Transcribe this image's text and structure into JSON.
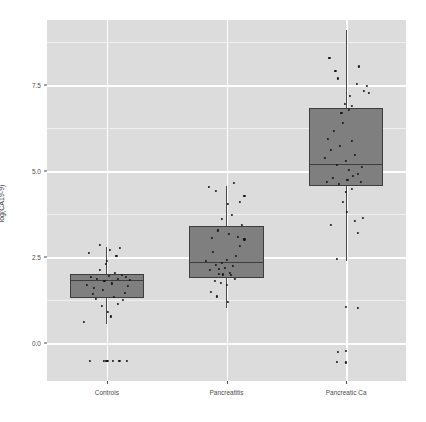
{
  "chart_data": {
    "type": "boxplot",
    "title": "",
    "subtitle": "",
    "xlabel": "",
    "ylabel": "log(CA19-9)",
    "categories": [
      "Controls",
      "Pancreatitis",
      "Pancreatic Ca"
    ],
    "ylim": [
      -1.1,
      9.4
    ],
    "yticks": [
      0.0,
      2.5,
      5.0,
      7.5
    ],
    "ytick_labels": [
      "0.0",
      "2.5",
      "5.0",
      "7.5"
    ],
    "y_minor_ticks": [
      -1.25,
      1.25,
      3.75,
      6.25,
      8.75
    ],
    "grid": "major-and-minor horizontal, major vertical at category centers",
    "legend": "none",
    "theme": "grey background panel, white major gridlines",
    "box_fill": "#7f7f7f",
    "box_outline": "#3d3d3d",
    "point_color": "#141414",
    "panel_background": "#dcdcdc",
    "series": [
      {
        "name": "Controls",
        "box": {
          "q1": 1.3,
          "median": 1.85,
          "q3": 2.02,
          "whisker_low": 0.57,
          "whisker_high": 2.79
        },
        "points": [
          {
            "x": -0.34,
            "y": 1.7
          },
          {
            "x": -0.27,
            "y": 1.92
          },
          {
            "x": -0.21,
            "y": 1.62
          },
          {
            "x": -0.16,
            "y": 1.86
          },
          {
            "x": -0.11,
            "y": 2.13
          },
          {
            "x": -0.07,
            "y": 1.55
          },
          {
            "x": -0.04,
            "y": 1.8
          },
          {
            "x": 0.0,
            "y": 2.4
          },
          {
            "x": 0.04,
            "y": 1.95
          },
          {
            "x": 0.09,
            "y": 1.74
          },
          {
            "x": 0.14,
            "y": 2.05
          },
          {
            "x": 0.19,
            "y": 1.88
          },
          {
            "x": 0.25,
            "y": 1.99
          },
          {
            "x": 0.3,
            "y": 1.46
          },
          {
            "x": 0.35,
            "y": 1.66
          },
          {
            "x": -0.3,
            "y": 2.62
          },
          {
            "x": -0.12,
            "y": 2.85
          },
          {
            "x": 0.05,
            "y": 2.71
          },
          {
            "x": 0.16,
            "y": 2.55
          },
          {
            "x": 0.22,
            "y": 2.77
          },
          {
            "x": -0.02,
            "y": 2.31
          },
          {
            "x": 0.32,
            "y": 1.92
          },
          {
            "x": 0.38,
            "y": 1.84
          },
          {
            "x": -0.24,
            "y": 1.43
          },
          {
            "x": -0.18,
            "y": 1.29
          },
          {
            "x": 0.12,
            "y": 1.35
          },
          {
            "x": 0.27,
            "y": 1.26
          },
          {
            "x": -0.08,
            "y": 1.08
          },
          {
            "x": 0.02,
            "y": 0.9
          },
          {
            "x": 0.18,
            "y": 1.15
          },
          {
            "x": -0.38,
            "y": 0.62
          },
          {
            "x": 0.07,
            "y": 0.78
          },
          {
            "x": -0.05,
            "y": -0.52
          },
          {
            "x": -0.02,
            "y": -0.52
          },
          {
            "x": 0.01,
            "y": -0.52
          },
          {
            "x": 0.1,
            "y": -0.52
          },
          {
            "x": 0.21,
            "y": -0.52
          },
          {
            "x": -0.28,
            "y": -0.52
          },
          {
            "x": 0.33,
            "y": -0.52
          }
        ]
      },
      {
        "name": "Pancreatitis",
        "box": {
          "q1": 1.88,
          "median": 2.36,
          "q3": 3.42,
          "whisker_low": 1.02,
          "whisker_high": 4.58
        },
        "points": [
          {
            "x": -0.35,
            "y": 2.4
          },
          {
            "x": -0.28,
            "y": 2.12
          },
          {
            "x": -0.22,
            "y": 2.65
          },
          {
            "x": -0.17,
            "y": 2.28
          },
          {
            "x": -0.12,
            "y": 2.02
          },
          {
            "x": -0.07,
            "y": 2.34
          },
          {
            "x": -0.03,
            "y": 2.2
          },
          {
            "x": 0.01,
            "y": 2.42
          },
          {
            "x": 0.06,
            "y": 2.05
          },
          {
            "x": 0.11,
            "y": 2.26
          },
          {
            "x": 0.16,
            "y": 2.55
          },
          {
            "x": 0.23,
            "y": 2.82
          },
          {
            "x": 0.3,
            "y": 3.02
          },
          {
            "x": -0.24,
            "y": 3.05
          },
          {
            "x": -0.14,
            "y": 3.28
          },
          {
            "x": 0.04,
            "y": 3.18
          },
          {
            "x": 0.19,
            "y": 3.1
          },
          {
            "x": 0.26,
            "y": 3.45
          },
          {
            "x": -0.08,
            "y": 3.62
          },
          {
            "x": 0.09,
            "y": 3.72
          },
          {
            "x": 0.03,
            "y": 4.05
          },
          {
            "x": 0.22,
            "y": 4.12
          },
          {
            "x": 0.3,
            "y": 4.28
          },
          {
            "x": -0.18,
            "y": 4.42
          },
          {
            "x": -0.3,
            "y": 4.55
          },
          {
            "x": 0.12,
            "y": 4.66
          },
          {
            "x": -0.2,
            "y": 1.82
          },
          {
            "x": -0.1,
            "y": 1.76
          },
          {
            "x": 0.0,
            "y": 1.7
          },
          {
            "x": 0.14,
            "y": 1.88
          },
          {
            "x": -0.26,
            "y": 1.48
          },
          {
            "x": -0.16,
            "y": 1.36
          },
          {
            "x": 0.02,
            "y": 1.2
          },
          {
            "x": -0.06,
            "y": 2.0
          },
          {
            "x": 0.07,
            "y": 1.98
          },
          {
            "x": -0.13,
            "y": 2.16
          }
        ]
      },
      {
        "name": "Pancreatic Ca",
        "box": {
          "q1": 4.58,
          "median": 5.22,
          "q3": 6.84,
          "whisker_low": 2.38,
          "whisker_high": 9.12
        },
        "points": [
          {
            "x": -0.36,
            "y": 5.4
          },
          {
            "x": -0.3,
            "y": 5.95
          },
          {
            "x": -0.25,
            "y": 5.62
          },
          {
            "x": -0.2,
            "y": 6.18
          },
          {
            "x": -0.15,
            "y": 5.18
          },
          {
            "x": -0.1,
            "y": 5.75
          },
          {
            "x": -0.05,
            "y": 6.4
          },
          {
            "x": 0.0,
            "y": 5.3
          },
          {
            "x": 0.05,
            "y": 5.05
          },
          {
            "x": 0.1,
            "y": 5.88
          },
          {
            "x": 0.15,
            "y": 5.48
          },
          {
            "x": 0.2,
            "y": 4.92
          },
          {
            "x": 0.26,
            "y": 5.12
          },
          {
            "x": -0.32,
            "y": 4.7
          },
          {
            "x": -0.22,
            "y": 4.82
          },
          {
            "x": -0.12,
            "y": 4.64
          },
          {
            "x": 0.02,
            "y": 4.74
          },
          {
            "x": 0.12,
            "y": 4.86
          },
          {
            "x": 0.24,
            "y": 4.68
          },
          {
            "x": -0.08,
            "y": 6.7
          },
          {
            "x": 0.04,
            "y": 6.78
          },
          {
            "x": 0.09,
            "y": 6.9
          },
          {
            "x": -0.02,
            "y": 6.95
          },
          {
            "x": 0.3,
            "y": 7.35
          },
          {
            "x": 0.18,
            "y": 7.55
          },
          {
            "x": -0.14,
            "y": 7.7
          },
          {
            "x": 0.35,
            "y": 7.48
          },
          {
            "x": 0.06,
            "y": 7.2
          },
          {
            "x": -0.28,
            "y": 8.3
          },
          {
            "x": -0.18,
            "y": 7.92
          },
          {
            "x": 0.22,
            "y": 8.05
          },
          {
            "x": 0.38,
            "y": 7.28
          },
          {
            "x": 0.01,
            "y": 3.82
          },
          {
            "x": 0.14,
            "y": 3.56
          },
          {
            "x": 0.28,
            "y": 3.65
          },
          {
            "x": -0.26,
            "y": 3.45
          },
          {
            "x": 0.2,
            "y": 3.22
          },
          {
            "x": -0.06,
            "y": 4.12
          },
          {
            "x": -0.16,
            "y": 2.46
          },
          {
            "x": 0.0,
            "y": 1.05
          },
          {
            "x": 0.19,
            "y": 1.02
          },
          {
            "x": -0.14,
            "y": -0.25
          },
          {
            "x": 0.0,
            "y": -0.22
          },
          {
            "x": -0.15,
            "y": -0.55
          },
          {
            "x": 0.0,
            "y": -0.56
          },
          {
            "x": 0.0,
            "y": 4.4
          },
          {
            "x": 0.1,
            "y": 4.48
          }
        ]
      }
    ]
  },
  "axis": {
    "y_title": "log(CA19-9)",
    "y_labels": [
      "0.0",
      "2.5",
      "5.0",
      "7.5"
    ],
    "x_labels": [
      "Controls",
      "Pancreatitis",
      "Pancreatic Ca"
    ]
  }
}
